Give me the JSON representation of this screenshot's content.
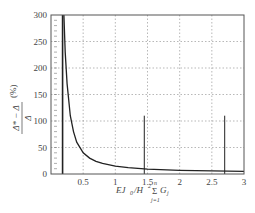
{
  "chart_data": {
    "type": "line",
    "title": "",
    "xlabel": "EJ_0/H^2 Σ_{j=1}^{n} G_j",
    "ylabel": "(Δ* − Δ)/Δ (%)",
    "xlim": [
      0,
      3
    ],
    "ylim": [
      0,
      300
    ],
    "x_ticks": [
      0,
      0.5,
      1,
      1.5,
      2,
      2.5,
      3
    ],
    "x_tick_labels": [
      "0.5",
      "1",
      "1.5",
      "2",
      "2.5",
      "3"
    ],
    "y_ticks": [
      0,
      50,
      100,
      150,
      200,
      250,
      300
    ],
    "y_tick_labels": [
      "0",
      "50",
      "100",
      "150",
      "200",
      "250",
      "300"
    ],
    "grid": true,
    "legend": null,
    "series": [
      {
        "name": "relative error curve",
        "x": [
          0.2,
          0.22,
          0.25,
          0.3,
          0.35,
          0.4,
          0.5,
          0.6,
          0.7,
          0.8,
          1.0,
          1.2,
          1.5,
          2.0,
          2.5,
          3.0
        ],
        "y": [
          300,
          230,
          170,
          110,
          80,
          60,
          40,
          30,
          24,
          20,
          15,
          12,
          9,
          7,
          6,
          5
        ]
      }
    ],
    "annotations": [
      {
        "type": "vline",
        "x": 0.18,
        "y_from": 0,
        "y_to": 300,
        "style": "thick"
      },
      {
        "type": "vline",
        "x": 1.45,
        "y_from": 0,
        "y_to": 110,
        "style": "thin"
      },
      {
        "type": "vline",
        "x": 2.7,
        "y_from": 0,
        "y_to": 110,
        "style": "thin"
      }
    ]
  },
  "labels": {
    "y_axis_fraction_numerator": "Δ* − Δ",
    "y_axis_fraction_denominator": "Δ",
    "y_axis_unit": "(%)",
    "x_axis_main": "EJ",
    "x_axis_sub0": "0",
    "x_axis_div": "/H",
    "x_axis_sup2": "2",
    "x_axis_sum": "Σ",
    "x_axis_sum_top": "n",
    "x_axis_sum_bottom": "j=1",
    "x_axis_g": "G",
    "x_axis_gsub": "j",
    "origin": "0"
  }
}
